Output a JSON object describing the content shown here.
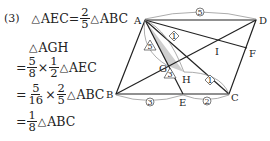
{
  "problem_number": "(3)",
  "solution": {
    "line1": {
      "lhs": "AEC",
      "eq": "=",
      "num": "2",
      "den": "5",
      "rhs": "ABC"
    },
    "line2": {
      "text": "AGH"
    },
    "line3": {
      "eq": "=",
      "num1": "5",
      "den1": "8",
      "times": "×",
      "num2": "1",
      "den2": "2",
      "rhs": "AEC"
    },
    "line4": {
      "eq": "=",
      "num1": "5",
      "den1": "16",
      "times": "×",
      "num2": "2",
      "den2": "5",
      "rhs": "ABC"
    },
    "line5": {
      "eq": "=",
      "num": "1",
      "den": "8",
      "rhs": "ABC"
    },
    "triangle_symbol": "△"
  },
  "diagram": {
    "points": {
      "A": "A",
      "B": "B",
      "C": "C",
      "D": "D",
      "E": "E",
      "F": "F",
      "G": "G",
      "H": "H",
      "I": "I"
    },
    "ratio_labels": {
      "AD": "5",
      "BE": "3",
      "EC": "2",
      "AH": "1",
      "HC": "1",
      "AG": "5",
      "GE": "3"
    },
    "shading_color": "#cccccc"
  }
}
